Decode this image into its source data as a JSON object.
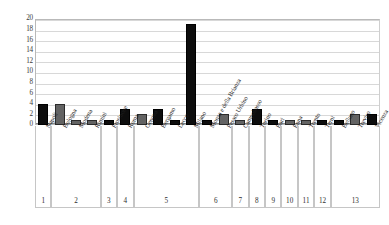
{
  "chart_data": {
    "type": "bar",
    "title": "",
    "subtitle": "",
    "xlabel": "",
    "ylabel": "",
    "ylim": [
      0,
      20
    ],
    "ytick_step": 2,
    "ytick_labels": [
      "20",
      "18",
      "16",
      "14",
      "12",
      "10",
      "8",
      "6",
      "4",
      "2",
      "0"
    ],
    "grid": true,
    "legend_position": "none",
    "categories": [
      "Napoli",
      "Bologna",
      "Modena",
      "Rimini",
      "Frosinone",
      "Roma",
      "Genova",
      "Bergamo",
      "Lecco",
      "Milano",
      "Monza e della Brianza",
      "Pesaro Urbino",
      "Campobasso",
      "Torino",
      "Bari",
      "Enna",
      "Trento",
      "Terni",
      "Belluno",
      "Treviso",
      "Vicenza"
    ],
    "values": [
      4,
      4,
      1,
      1,
      1,
      3,
      2,
      3,
      1,
      19,
      1,
      2,
      1,
      3,
      1,
      1,
      1,
      1,
      1,
      2,
      2
    ],
    "bar_colors": [
      "dark",
      "gray",
      "gray",
      "gray",
      "dark",
      "dark",
      "gray",
      "dark",
      "dark",
      "dark",
      "dark",
      "gray",
      "gray",
      "dark",
      "dark",
      "gray",
      "gray",
      "dark",
      "dark",
      "gray",
      "dark"
    ],
    "colors": {
      "dark": "#0d0d0d",
      "gray": "#636363",
      "gridline": "#d8d8d8",
      "axis": "#8c8c8c",
      "plot_border": "#b9b9b9"
    },
    "groups": [
      {
        "number": "1",
        "span": 1
      },
      {
        "number": "2",
        "span": 3
      },
      {
        "number": "3",
        "span": 1
      },
      {
        "number": "4",
        "span": 1
      },
      {
        "number": "5",
        "span": 4
      },
      {
        "number": "6",
        "span": 2
      },
      {
        "number": "7",
        "span": 1
      },
      {
        "number": "8",
        "span": 1
      },
      {
        "number": "9",
        "span": 1
      },
      {
        "number": "10",
        "span": 1
      },
      {
        "number": "11",
        "span": 1
      },
      {
        "number": "12",
        "span": 1
      },
      {
        "number": "13",
        "span": 3
      }
    ]
  }
}
